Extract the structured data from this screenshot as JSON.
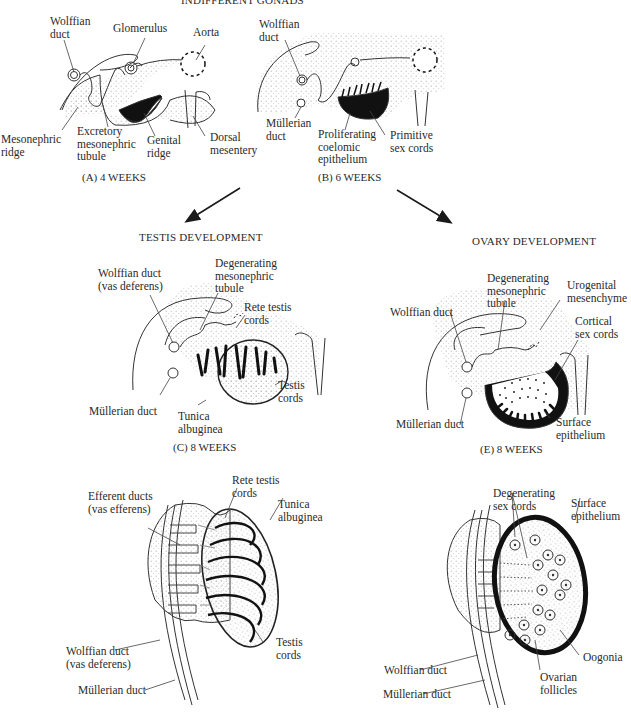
{
  "title": "INDIFFERENT GONADS",
  "panels": {
    "A": {
      "caption": "(A)   4 WEEKS",
      "labels": {
        "wolffian_duct": [
          "Wolffian",
          "duct"
        ],
        "glomerulus": "Glomerulus",
        "aorta": "Aorta",
        "mesonephric_ridge": [
          "Mesonephric",
          "ridge"
        ],
        "excretory_tubule": [
          "Excretory",
          "mesonephric",
          "tubule"
        ],
        "genital_ridge": [
          "Genital",
          "ridge"
        ],
        "dorsal_mesentery": [
          "Dorsal",
          "mesentery"
        ]
      }
    },
    "B": {
      "caption": "(B)   6 WEEKS",
      "labels": {
        "wolffian_duct": [
          "Wolffian",
          "duct"
        ],
        "mullerian_duct": [
          "Müllerian",
          "duct"
        ],
        "proliferating_epithelium": [
          "Proliferating",
          "coelomic",
          "epithelium"
        ],
        "primitive_sex_cords": [
          "Primitive",
          "sex cords"
        ]
      }
    },
    "C": {
      "heading": "TESTIS DEVELOPMENT",
      "caption": "(C)   8 WEEKS",
      "labels": {
        "wolffian_duct": [
          "Wolffian duct",
          "(vas deferens)"
        ],
        "degenerating_tubule": [
          "Degenerating",
          "mesonephric",
          "tubule"
        ],
        "rete_testis_cords": [
          "Rete testis",
          "cords"
        ],
        "testis_cords": [
          "Testis",
          "cords"
        ],
        "mullerian_duct": "Müllerian duct",
        "tunica_albuginea": [
          "Tunica",
          "albuginea"
        ]
      }
    },
    "D": {
      "labels": {
        "efferent_ducts": [
          "Efferent ducts",
          "(vas efferens)"
        ],
        "rete_testis_cords": [
          "Rete testis",
          "cords"
        ],
        "tunica_albuginea": [
          "Tunica",
          "albuginea"
        ],
        "testis_cords": [
          "Testis",
          "cords"
        ],
        "wolffian_duct": [
          "Wolffian duct",
          "(vas deferens)"
        ],
        "mullerian_duct": "Müllerian duct"
      }
    },
    "E": {
      "heading": "OVARY DEVELOPMENT",
      "caption": "(E)   8 WEEKS",
      "labels": {
        "degenerating_tubule": [
          "Degenerating",
          "mesonephric",
          "tubule"
        ],
        "urogenital_mesenchyme": [
          "Urogenital",
          "mesenchyme"
        ],
        "wolffian_duct": "Wolffian duct",
        "cortical_sex_cords": [
          "Cortical",
          "sex cords"
        ],
        "mullerian_duct": "Müllerian duct",
        "surface_epithelium": [
          "Surface",
          "epithelium"
        ]
      }
    },
    "F": {
      "labels": {
        "degenerating_sex_cords": [
          "Degenerating",
          "sex cords"
        ],
        "surface_epithelium": [
          "Surface",
          "epithelium"
        ],
        "oogonia": "Oogonia",
        "ovarian_follicles": [
          "Ovarian",
          "follicles"
        ],
        "wolffian_duct": "Wolffian duct",
        "mullerian_duct": "Müllerian duct"
      }
    }
  },
  "colors": {
    "ink": "#1a1a1a",
    "stipple": "#bdbdbd",
    "text": "#2a2a2a",
    "background": "#ffffff"
  }
}
